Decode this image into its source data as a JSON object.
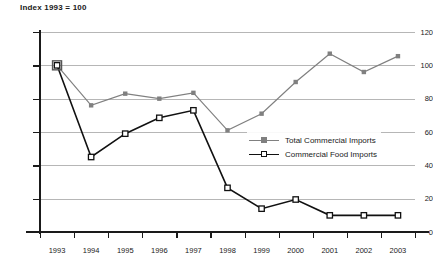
{
  "chart_data": {
    "type": "line",
    "title": "Index 1993 = 100",
    "xlabel": "",
    "ylabel": "",
    "ylim": [
      0,
      120
    ],
    "yticks": [
      0,
      20,
      40,
      60,
      80,
      100,
      120
    ],
    "grid": true,
    "legend_position": "inside-center-right",
    "categories": [
      "1993",
      "1994",
      "1995",
      "1996",
      "1997",
      "1998",
      "1999",
      "2000",
      "2001",
      "2002",
      "2003"
    ],
    "series": [
      {
        "name": "Total Commercial Imports",
        "color": "#808080",
        "marker": "filled-square",
        "values": [
          100,
          76,
          83,
          80,
          83.5,
          61,
          71,
          90,
          107,
          96,
          105.5
        ]
      },
      {
        "name": "Commercial Food Imports",
        "color": "#111111",
        "marker": "open-square",
        "values": [
          100,
          45,
          59,
          68.5,
          73,
          26.5,
          14,
          19.5,
          10,
          10,
          10
        ]
      }
    ]
  },
  "legend": {
    "items": [
      {
        "label": "Total Commercial Imports"
      },
      {
        "label": "Commercial Food Imports"
      }
    ]
  },
  "colors": {
    "series_total": "#808080",
    "series_food": "#111111",
    "gridline": "#b6b6b6",
    "axis": "#1a1a1a",
    "background": "#ffffff"
  }
}
